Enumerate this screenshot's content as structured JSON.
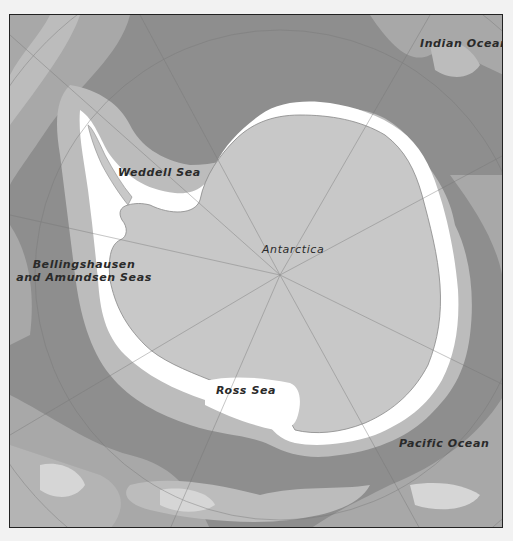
{
  "map": {
    "title": "Antarctica and the Southern Ocean",
    "labels": {
      "indian_ocean": "Indian Ocean",
      "weddell_sea": "Weddell Sea",
      "antarctica": "Antarctica",
      "bellingshausen_line1": "Bellingshausen",
      "bellingshausen_line2": "and Amundsen Seas",
      "ross_sea": "Ross Sea",
      "pacific_ocean": "Pacific Ocean"
    },
    "colors": {
      "background": "#f2f2f2",
      "frame_border": "#222222",
      "deep_ocean": "#8e8e8e",
      "mid_ocean": "#a8a8a8",
      "shallow_ocean": "#bcbcbc",
      "shelf": "#d6d6d6",
      "coastal_ice": "#ffffff",
      "land": "#c8c8c8",
      "graticule": "#777777",
      "label_text": "#2a2a2a"
    }
  }
}
